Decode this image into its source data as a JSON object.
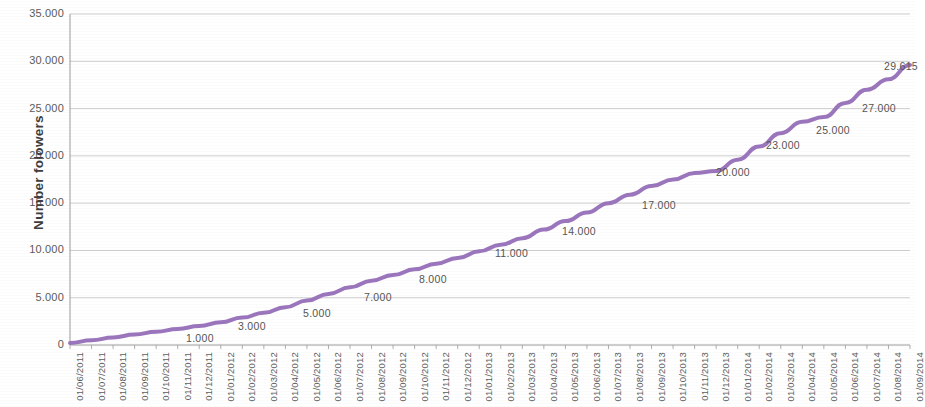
{
  "chart_data": {
    "type": "line",
    "title": "",
    "subtitle": "",
    "xlabel": "",
    "ylabel": "Number folowers",
    "ylim": [
      0,
      35000
    ],
    "ytick_labels": [
      "0",
      "5.000",
      "10.000",
      "15.000",
      "20.000",
      "25.000",
      "30.000",
      "35.000"
    ],
    "ytick_values": [
      0,
      5000,
      10000,
      15000,
      20000,
      25000,
      30000,
      35000
    ],
    "grid": true,
    "grid_axis": "y",
    "legend": "none",
    "line_color": "#9b76bd",
    "line_width": 4,
    "marker": "none",
    "categories": [
      "01/06/2011",
      "01/07/2011",
      "01/08/2011",
      "01/09/2011",
      "01/10/2011",
      "01/11/2011",
      "01/12/2011",
      "01/01/2012",
      "01/02/2012",
      "01/03/2012",
      "01/04/2012",
      "01/05/2012",
      "01/06/2012",
      "01/07/2012",
      "01/08/2012",
      "01/09/2012",
      "01/10/2012",
      "01/11/2012",
      "01/12/2012",
      "01/01/2013",
      "01/02/2013",
      "01/03/2013",
      "01/04/2013",
      "01/05/2013",
      "01/06/2013",
      "01/07/2013",
      "01/08/2013",
      "01/09/2013",
      "01/10/2013",
      "01/11/2013",
      "01/12/2013",
      "01/01/2014",
      "01/02/2014",
      "01/03/2014",
      "01/04/2014",
      "01/05/2014",
      "01/06/2014",
      "01/07/2014",
      "01/08/2014",
      "01/09/2014"
    ],
    "series": [
      {
        "name": "Number folowers",
        "values": [
          200,
          500,
          800,
          1100,
          1400,
          1700,
          2000,
          2400,
          2900,
          3400,
          4000,
          4700,
          5400,
          6100,
          6800,
          7400,
          8000,
          8600,
          9200,
          9900,
          10600,
          11300,
          12200,
          13100,
          14000,
          15000,
          15900,
          16800,
          17500,
          18200,
          18400,
          19600,
          21000,
          22400,
          23600,
          24100,
          25600,
          27000,
          28100,
          29615
        ]
      }
    ],
    "data_labels": [
      {
        "text": "1.000",
        "category": "01/01/2012",
        "value": 2000
      },
      {
        "text": "3.000",
        "category": "01/04/2012",
        "value": 4000
      },
      {
        "text": "5.000",
        "category": "01/07/2012",
        "value": 6100
      },
      {
        "text": "7.000",
        "category": "01/10/2012",
        "value": 8000
      },
      {
        "text": "8.000",
        "category": "01/12/2012",
        "value": 9200
      },
      {
        "text": "11.000",
        "category": "01/03/2013",
        "value": 11300
      },
      {
        "text": "14.000",
        "category": "01/06/2013",
        "value": 14000
      },
      {
        "text": "17.000",
        "category": "01/09/2013",
        "value": 16800
      },
      {
        "text": "20.000",
        "category": "01/12/2013",
        "value": 18400
      },
      {
        "text": "23.000",
        "category": "01/03/2014",
        "value": 22400
      },
      {
        "text": "25.000",
        "category": "01/05/2014",
        "value": 24100
      },
      {
        "text": "27.000",
        "category": "01/07/2014",
        "value": 27000
      },
      {
        "text": "29.615",
        "category": "01/09/2014",
        "value": 29615
      }
    ],
    "label_positions": [
      {
        "x": 186,
        "y": 332
      },
      {
        "x": 238,
        "y": 320
      },
      {
        "x": 303,
        "y": 307
      },
      {
        "x": 364,
        "y": 291
      },
      {
        "x": 419,
        "y": 273
      },
      {
        "x": 495,
        "y": 247
      },
      {
        "x": 562,
        "y": 225
      },
      {
        "x": 642,
        "y": 199
      },
      {
        "x": 716,
        "y": 166
      },
      {
        "x": 766,
        "y": 139
      },
      {
        "x": 816,
        "y": 124
      },
      {
        "x": 862,
        "y": 102
      },
      {
        "x": 884,
        "y": 60
      }
    ]
  },
  "axes": {
    "plot_left": 70,
    "plot_right": 910,
    "plot_top": 14,
    "plot_bottom": 345
  }
}
